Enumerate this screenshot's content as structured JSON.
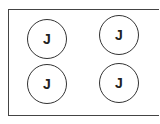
{
  "buttons": [
    {
      "label": "J"
    },
    {
      "label": "J"
    },
    {
      "label": "J"
    },
    {
      "label": "J"
    }
  ]
}
